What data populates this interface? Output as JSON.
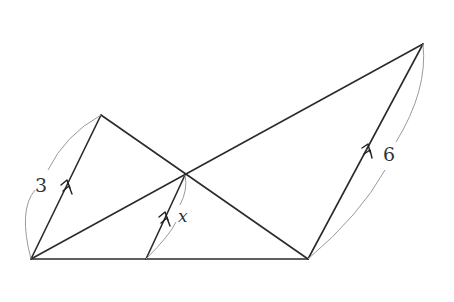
{
  "diagram": {
    "type": "geometry",
    "points": {
      "A": [
        31,
        259
      ],
      "B": [
        101,
        115
      ],
      "P": [
        185,
        175
      ],
      "Q": [
        146,
        259
      ],
      "C": [
        308,
        259
      ],
      "D": [
        423,
        44
      ]
    },
    "segments": [
      {
        "from": "A",
        "to": "C",
        "role": "base"
      },
      {
        "from": "A",
        "to": "B",
        "role": "parallel-side",
        "label": "3"
      },
      {
        "from": "B",
        "to": "C",
        "role": "diagonal"
      },
      {
        "from": "A",
        "to": "D",
        "role": "diagonal"
      },
      {
        "from": "C",
        "to": "D",
        "role": "parallel-side",
        "label": "6"
      },
      {
        "from": "Q",
        "to": "P",
        "role": "parallel-segment",
        "label": "x"
      }
    ],
    "parallel_marks": "double-arrow",
    "labels": {
      "left": "3",
      "middle": "x",
      "right": "6"
    },
    "colors": {
      "line": "#2b2b2b",
      "arc": "#9a9a9a",
      "text": "#333333",
      "background": "#ffffff"
    }
  }
}
